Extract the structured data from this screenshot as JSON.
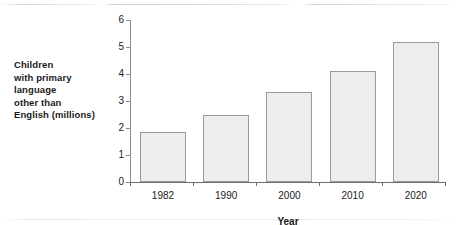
{
  "chart_data": {
    "type": "bar",
    "title": "",
    "categories": [
      "1982",
      "1990",
      "2000",
      "2010",
      "2020"
    ],
    "values": [
      1.85,
      2.5,
      3.35,
      4.1,
      5.2
    ],
    "xlabel": "Year",
    "ylabel": "Children with primary language other than English (millions)",
    "ylabel_lines": [
      "Children",
      "with primary",
      "language",
      "other than",
      "English (millions)"
    ],
    "ylim": [
      0,
      6
    ],
    "ytick_labels": [
      "0",
      "1",
      "2",
      "3",
      "4",
      "5",
      "6"
    ],
    "ytick_values": [
      0,
      1,
      2,
      3,
      4,
      5,
      6
    ],
    "grid": false,
    "legend": null,
    "colors": {
      "bar_fill": "#eeecec",
      "bar_border": "#9a9a9a",
      "axis": "#8c8c8c",
      "text": "#1b1b1b"
    }
  }
}
